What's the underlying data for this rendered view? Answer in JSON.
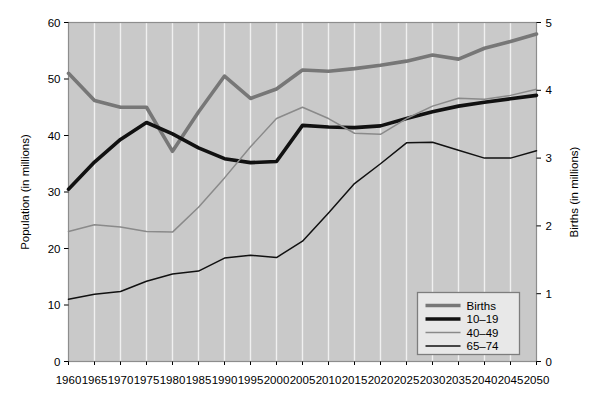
{
  "chart_data": {
    "type": "line",
    "title": "",
    "xlabel": "",
    "ylabel": "Population (in millions)",
    "y2label": "Births (in millions)",
    "x": [
      1960,
      1965,
      1970,
      1975,
      1980,
      1985,
      1990,
      1995,
      2000,
      2005,
      2010,
      2015,
      2020,
      2025,
      2030,
      2035,
      2040,
      2045,
      2050
    ],
    "xtick_labels": [
      "1960",
      "1965",
      "1970",
      "1975",
      "1980",
      "1985",
      "1990",
      "1995",
      "2000",
      "2005",
      "2010",
      "2015",
      "2020",
      "2025",
      "2030",
      "2035",
      "2040",
      "2045",
      "2050"
    ],
    "xlim": [
      1960,
      2050
    ],
    "ylim": [
      0,
      60
    ],
    "ytick_labels": [
      "0",
      "10",
      "20",
      "30",
      "40",
      "50",
      "60"
    ],
    "ytick_values": [
      0,
      10,
      20,
      30,
      40,
      50,
      60
    ],
    "y2lim": [
      0,
      5
    ],
    "y2tick_labels": [
      "0",
      "1",
      "2",
      "3",
      "4",
      "5"
    ],
    "y2tick_values": [
      0,
      1,
      2,
      3,
      4,
      5
    ],
    "grid": "vertical",
    "legend_position": "bottom-right",
    "plot_background": "#c9c9c9",
    "series": [
      {
        "name": "Births",
        "axis": "right",
        "color": "#777777",
        "width": 3.6,
        "units": "millions of births",
        "values": [
          4.25,
          3.85,
          3.75,
          3.75,
          3.1,
          3.68,
          4.21,
          3.88,
          4.02,
          4.3,
          4.28,
          4.32,
          4.37,
          4.43,
          4.52,
          4.46,
          4.62,
          4.72,
          4.83
        ]
      },
      {
        "name": "10–19",
        "axis": "left",
        "color": "#111111",
        "width": 3.6,
        "units": "millions of people",
        "values": [
          30.5,
          35.3,
          39.3,
          42.3,
          40.3,
          37.8,
          35.9,
          35.2,
          35.4,
          41.8,
          41.5,
          41.4,
          41.7,
          43.0,
          44.2,
          45.2,
          45.9,
          46.5,
          47.1
        ]
      },
      {
        "name": "40–49",
        "axis": "left",
        "color": "#8a8a8a",
        "width": 1.5,
        "units": "millions of people",
        "values": [
          23.0,
          24.2,
          23.8,
          23.0,
          22.9,
          27.3,
          32.5,
          38.0,
          43.0,
          45.0,
          43.0,
          40.4,
          40.2,
          43.0,
          45.2,
          46.6,
          46.4,
          47.1,
          48.2
        ]
      },
      {
        "name": "65–74",
        "axis": "left",
        "color": "#111111",
        "width": 1.5,
        "units": "millions of people",
        "values": [
          11.0,
          11.9,
          12.4,
          14.2,
          15.5,
          16.0,
          18.3,
          18.8,
          18.4,
          21.3,
          26.3,
          31.5,
          35.0,
          38.7,
          38.8,
          37.4,
          36.0,
          36.0,
          37.3
        ]
      }
    ]
  },
  "axes": {
    "left_title": "Population (in millions)",
    "right_title": "Births (in millions)"
  },
  "legend": {
    "entries": [
      {
        "label": "Births"
      },
      {
        "label": "10–19"
      },
      {
        "label": "40–49"
      },
      {
        "label": "65–74"
      }
    ]
  }
}
